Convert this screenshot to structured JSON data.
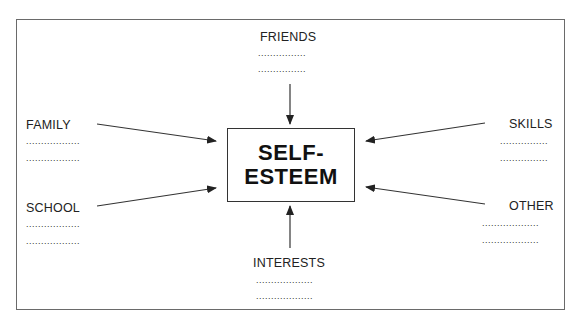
{
  "diagram": {
    "center": {
      "line1": "SELF-",
      "line2": "ESTEEM"
    },
    "nodes": {
      "friends": {
        "label": "FRIENDS",
        "dots1": "................",
        "dots2": "................"
      },
      "family": {
        "label": "FAMILY",
        "dots1": "..................",
        "dots2": ".................."
      },
      "school": {
        "label": "SCHOOL",
        "dots1": "..................",
        "dots2": ".................."
      },
      "skills": {
        "label": "SKILLS",
        "dots1": "................",
        "dots2": "................"
      },
      "other": {
        "label": "OTHER",
        "dots1": "...................",
        "dots2": "..................."
      },
      "interests": {
        "label": "INTERESTS",
        "dots1": "...................",
        "dots2": "..................."
      }
    },
    "edges": [
      {
        "from": "FRIENDS",
        "to": "SELF-ESTEEM"
      },
      {
        "from": "FAMILY",
        "to": "SELF-ESTEEM"
      },
      {
        "from": "SCHOOL",
        "to": "SELF-ESTEEM"
      },
      {
        "from": "SKILLS",
        "to": "SELF-ESTEEM"
      },
      {
        "from": "OTHER",
        "to": "SELF-ESTEEM"
      },
      {
        "from": "INTERESTS",
        "to": "SELF-ESTEEM"
      }
    ]
  }
}
